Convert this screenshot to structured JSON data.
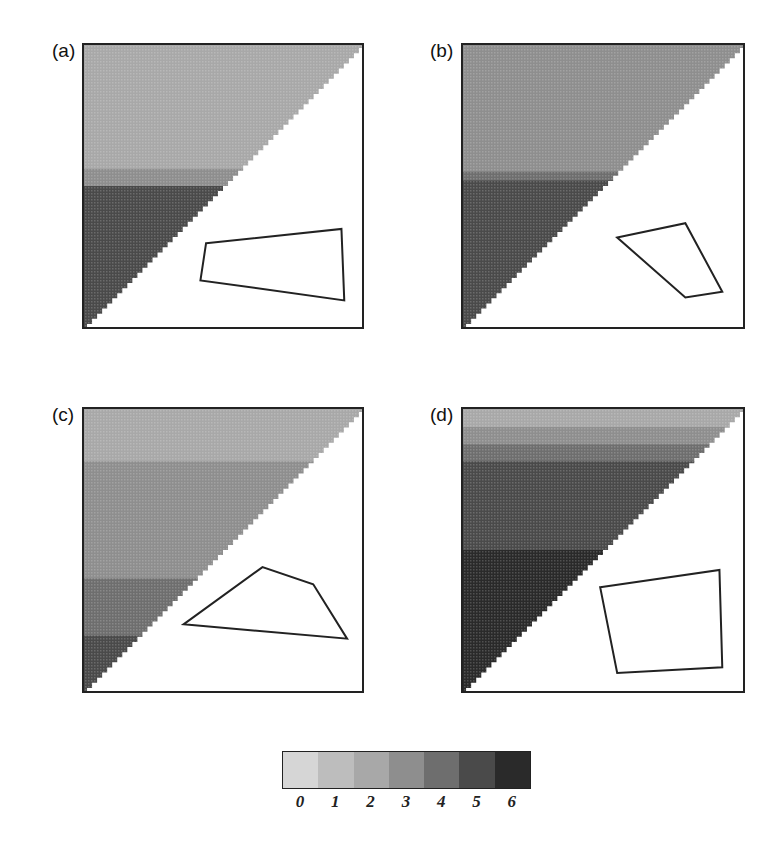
{
  "chart_data": [
    {
      "type": "heatmap",
      "title": "(a)",
      "note": "Upper-left triangular matrix; shading by row band; polygon outline drawn in lower-right white region",
      "row_bands": [
        {
          "from": 0.0,
          "to": 0.44,
          "value": 2
        },
        {
          "from": 0.44,
          "to": 0.5,
          "value": 3
        },
        {
          "from": 0.5,
          "to": 1.0,
          "value": 4.5
        }
      ],
      "polygon": [
        [
          0.44,
          0.7
        ],
        [
          0.92,
          0.65
        ],
        [
          0.93,
          0.9
        ],
        [
          0.42,
          0.83
        ]
      ]
    },
    {
      "type": "heatmap",
      "title": "(b)",
      "row_bands": [
        {
          "from": 0.0,
          "to": 0.45,
          "value": 2.5
        },
        {
          "from": 0.45,
          "to": 0.48,
          "value": 3.5
        },
        {
          "from": 0.48,
          "to": 1.0,
          "value": 5
        }
      ],
      "polygon": [
        [
          0.55,
          0.68
        ],
        [
          0.79,
          0.63
        ],
        [
          0.92,
          0.87
        ],
        [
          0.79,
          0.89
        ]
      ]
    },
    {
      "type": "heatmap",
      "title": "(c)",
      "row_bands": [
        {
          "from": 0.0,
          "to": 0.19,
          "value": 2
        },
        {
          "from": 0.19,
          "to": 0.6,
          "value": 2.5
        },
        {
          "from": 0.6,
          "to": 0.8,
          "value": 3.5
        },
        {
          "from": 0.8,
          "to": 1.0,
          "value": 4.5
        }
      ],
      "polygon": [
        [
          0.36,
          0.76
        ],
        [
          0.64,
          0.56
        ],
        [
          0.82,
          0.62
        ],
        [
          0.94,
          0.81
        ]
      ]
    },
    {
      "type": "heatmap",
      "title": "(d)",
      "row_bands": [
        {
          "from": 0.0,
          "to": 0.07,
          "value": 2
        },
        {
          "from": 0.07,
          "to": 0.13,
          "value": 3
        },
        {
          "from": 0.13,
          "to": 0.19,
          "value": 4
        },
        {
          "from": 0.19,
          "to": 0.5,
          "value": 5
        },
        {
          "from": 0.5,
          "to": 1.0,
          "value": 5.5
        }
      ],
      "polygon": [
        [
          0.49,
          0.63
        ],
        [
          0.91,
          0.57
        ],
        [
          0.92,
          0.91
        ],
        [
          0.55,
          0.93
        ]
      ]
    }
  ],
  "panels": [
    {
      "label": "(a)"
    },
    {
      "label": "(b)"
    },
    {
      "label": "(c)"
    },
    {
      "label": "(d)"
    }
  ],
  "colorbar": {
    "ticks": [
      "0",
      "1",
      "2",
      "3",
      "4",
      "5",
      "6"
    ],
    "colors": [
      "#d6d6d6",
      "#bdbdbd",
      "#a8a8a8",
      "#8e8e8e",
      "#6e6e6e",
      "#4a4a4a",
      "#2a2a2a"
    ]
  }
}
